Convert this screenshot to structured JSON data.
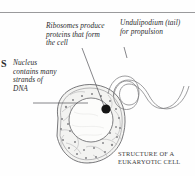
{
  "figure": {
    "title_caption": {
      "line1": "Structure of a",
      "line2": "Eukaryotic cell"
    },
    "margin_fragment": "S",
    "callouts": [
      {
        "name": "ribosomes",
        "text": "Ribosomes produce proteins that form the cell",
        "points_to": "ribosome-dot"
      },
      {
        "name": "undulipodium",
        "text": "Undulipodium (tail) for propulsion",
        "points_to": "tail"
      },
      {
        "name": "nucleus",
        "text": "Nucleus contains many strands of DNA",
        "points_to": "nucleus"
      }
    ],
    "parts": {
      "cell_membrane": "cell-membrane",
      "cytoplasm": "cytoplasm",
      "nucleus": "nucleus",
      "ribosome_dot": "ribosome-dot",
      "endoplasmic_reticulum": "endoplasmic-reticulum",
      "undulipodium": "undulipodium-tail"
    },
    "colors": {
      "ink": "#2b2b2d",
      "line": "#6f6f72",
      "rule": "#9a9a9c",
      "cytoplasm_fill": "#f3f3f1",
      "nucleus_fill": "#fbfbfa",
      "ribosome_fill": "#111111",
      "speck_fill": "#8d8d8f",
      "page_bg": "#fefefe"
    }
  }
}
